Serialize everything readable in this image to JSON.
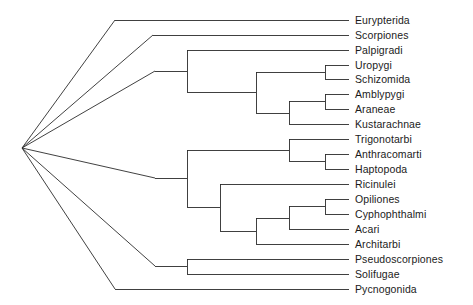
{
  "figure": {
    "type": "cladogram",
    "title": "",
    "background_color": "#ffffff",
    "line_color": "#2b2b2b",
    "text_color": "#1b1b1b"
  },
  "chart_data": {
    "type": "diagram",
    "subtype": "phylogenetic-cladogram",
    "orientation": "left-to-right",
    "title": "",
    "xlabel": "",
    "ylabel": "",
    "grid": false,
    "legend": "none",
    "root": {
      "x": 22,
      "y": 148,
      "polytomy_branches": 6
    },
    "taxa": [
      {
        "id": "eurypterida",
        "label": "Eurypterida",
        "y": 20,
        "tip_x": 349
      },
      {
        "id": "scorpiones",
        "label": "Scorpiones",
        "y": 35,
        "tip_x": 349
      },
      {
        "id": "palpigradi",
        "label": "Palpigradi",
        "y": 50,
        "tip_x": 349
      },
      {
        "id": "uropygi",
        "label": "Uropygi",
        "y": 65,
        "tip_x": 349
      },
      {
        "id": "schizomida",
        "label": "Schizomida",
        "y": 79,
        "tip_x": 349
      },
      {
        "id": "amblypygi",
        "label": "Amblypygi",
        "y": 94,
        "tip_x": 349
      },
      {
        "id": "araneae",
        "label": "Araneae",
        "y": 109,
        "tip_x": 349
      },
      {
        "id": "kustarachnae",
        "label": "Kustarachnae",
        "y": 124,
        "tip_x": 349
      },
      {
        "id": "trigonotarbi",
        "label": "Trigonotarbi",
        "y": 139,
        "tip_x": 349
      },
      {
        "id": "anthracomarti",
        "label": "Anthracomarti",
        "y": 154,
        "tip_x": 349
      },
      {
        "id": "haptopoda",
        "label": "Haptopoda",
        "y": 169,
        "tip_x": 349
      },
      {
        "id": "ricinulei",
        "label": "Ricinulei",
        "y": 184,
        "tip_x": 349
      },
      {
        "id": "opiliones",
        "label": "Opiliones",
        "y": 199,
        "tip_x": 349
      },
      {
        "id": "cyphophthalmi",
        "label": "Cyphophthalmi",
        "y": 214,
        "tip_x": 349
      },
      {
        "id": "acari",
        "label": "Acari",
        "y": 229,
        "tip_x": 349
      },
      {
        "id": "architarbi",
        "label": "Architarbi",
        "y": 244,
        "tip_x": 349
      },
      {
        "id": "pseudoscorpiones",
        "label": "Pseudoscorpiones",
        "y": 259,
        "tip_x": 349
      },
      {
        "id": "solifugae",
        "label": "Solifugae",
        "y": 274,
        "tip_x": 349
      },
      {
        "id": "pycnogonida",
        "label": "Pycnogonida",
        "y": 289,
        "tip_x": 349
      }
    ],
    "internal_nodes": [
      {
        "id": "node-uropygi-schizomida",
        "x": 325,
        "y_top": 65,
        "y_bottom": 79,
        "parent_y": 72
      },
      {
        "id": "node-amblypygi-araneae",
        "x": 325,
        "y_top": 94,
        "y_bottom": 109,
        "parent_y": 101
      },
      {
        "id": "node-araneae-kustarachnae",
        "x": 289,
        "y_top": 101,
        "y_bottom": 124,
        "parent_y": 113
      },
      {
        "id": "node-tetrapulmonata",
        "x": 256,
        "y_top": 72,
        "y_bottom": 113,
        "parent_y": 92
      },
      {
        "id": "node-palpigradi-clade",
        "x": 187,
        "y_top": 50,
        "y_bottom": 92,
        "parent_y": 71
      },
      {
        "id": "node-anthraco-haptopoda",
        "x": 325,
        "y_top": 154,
        "y_bottom": 169,
        "parent_y": 161
      },
      {
        "id": "node-trigono-group",
        "x": 289,
        "y_top": 139,
        "y_bottom": 161,
        "parent_y": 150
      },
      {
        "id": "node-opiliones-cyphoph",
        "x": 325,
        "y_top": 199,
        "y_bottom": 214,
        "parent_y": 206
      },
      {
        "id": "node-acari-group",
        "x": 289,
        "y_top": 206,
        "y_bottom": 229,
        "parent_y": 218
      },
      {
        "id": "node-architarbi-group",
        "x": 256,
        "y_top": 218,
        "y_bottom": 244,
        "parent_y": 231
      },
      {
        "id": "node-ricinulei-group",
        "x": 220,
        "y_top": 184,
        "y_bottom": 231,
        "parent_y": 207
      },
      {
        "id": "node-lower-clade",
        "x": 187,
        "y_top": 150,
        "y_bottom": 207,
        "parent_y": 178
      },
      {
        "id": "node-pseudo-solifugae",
        "x": 187,
        "y_top": 259,
        "y_bottom": 274,
        "parent_y": 266
      }
    ],
    "root_branches": [
      {
        "id": "branch-eurypterida",
        "to_x": 115,
        "to_y": 20
      },
      {
        "id": "branch-scorpiones",
        "to_x": 153,
        "to_y": 35
      },
      {
        "id": "branch-palpigradi",
        "to_x": 155,
        "to_y": 71
      },
      {
        "id": "branch-lower-clade",
        "to_x": 155,
        "to_y": 178
      },
      {
        "id": "branch-pseudo-soli",
        "to_x": 155,
        "to_y": 266
      },
      {
        "id": "branch-pycnogonida",
        "to_x": 115,
        "to_y": 289
      }
    ]
  }
}
